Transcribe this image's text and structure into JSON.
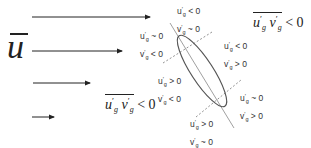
{
  "diagram": {
    "mean_flow_symbol": "u",
    "arrows": [
      {
        "x1": 32,
        "x2": 150,
        "y": 17
      },
      {
        "x1": 32,
        "x2": 122,
        "y": 51
      },
      {
        "x1": 33,
        "x2": 90,
        "y": 83
      },
      {
        "x1": 32,
        "x2": 54,
        "y": 117
      }
    ],
    "ellipse": {
      "cx": 202,
      "cy": 71,
      "rx": 42,
      "ry": 11,
      "rotation_deg": 57,
      "stroke": "#555555"
    },
    "major_axis_line": {
      "x1": 170,
      "y1": 23,
      "x2": 234,
      "y2": 128
    },
    "dashed_lines": [
      {
        "x1": 163,
        "y1": 63,
        "x2": 212,
        "y2": 32
      },
      {
        "x1": 196,
        "y1": 117,
        "x2": 241,
        "y2": 80
      }
    ],
    "quadrant_labels": [
      {
        "id": "top",
        "u": "u'g < 0",
        "v": "v'g ~ 0",
        "u_sign": "< 0",
        "v_sign": "~ 0"
      },
      {
        "id": "upper-left",
        "u": "u'g ~ 0",
        "v": "v'g < 0",
        "u_sign": "~ 0",
        "v_sign": "< 0"
      },
      {
        "id": "upper-right",
        "u": "u'g < 0",
        "v": "v'g > 0",
        "u_sign": "< 0",
        "v_sign": "> 0"
      },
      {
        "id": "lower-left",
        "u": "u'g > 0",
        "v": "v'g < 0",
        "u_sign": "> 0",
        "v_sign": "< 0"
      },
      {
        "id": "lower-right",
        "u": "u'g ~ 0",
        "v": "v'g > 0",
        "u_sign": "~ 0",
        "v_sign": "> 0"
      },
      {
        "id": "bottom",
        "u": "u'g > 0",
        "v": "v'g ~ 0",
        "u_sign": "> 0",
        "v_sign": "~ 0"
      }
    ],
    "formulas": [
      {
        "id": "top-right",
        "text": "u'g v'g < 0",
        "relation": "< 0"
      },
      {
        "id": "lower-left",
        "text": "u'g v'g < 0",
        "relation": "< 0"
      }
    ],
    "letters": {
      "u": "u",
      "v": "v",
      "prime": "′",
      "sub": "g"
    }
  }
}
